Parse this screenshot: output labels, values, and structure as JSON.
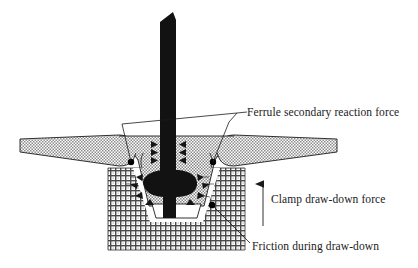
{
  "figure": {
    "type": "engineering-cross-section",
    "background_color": "#ffffff",
    "ink_color": "#000000"
  },
  "annotations": [
    {
      "id": "ferrule-secondary-reaction-force",
      "text": "Ferrule secondary reaction force",
      "leader": "two-branch",
      "points_to": [
        "ferrule-flange-left-corner",
        "ferrule-flange-right-corner"
      ]
    },
    {
      "id": "clamp-draw-down-force",
      "text": "Clamp draw-down force",
      "leader": "vertical-arrow-up",
      "direction": "up"
    },
    {
      "id": "friction-during-draw-down",
      "text": "Friction during draw-down",
      "leader": "diagonal",
      "points_to": [
        "ferrule-base-right-corner"
      ]
    }
  ],
  "parts": [
    {
      "id": "bolt-shaft",
      "label": "bolt shaft",
      "fill": "solid-black"
    },
    {
      "id": "bolt-bulge",
      "label": "upset bolt head bulge",
      "fill": "solid-black"
    },
    {
      "id": "panel-plate",
      "label": "sheet panel",
      "fill": "fine-crosshatch"
    },
    {
      "id": "ferrule",
      "label": "ferrule",
      "fill": "diagonal-crosshatch"
    },
    {
      "id": "base-block",
      "label": "base block",
      "fill": "grid-mesh"
    },
    {
      "id": "cavity",
      "label": "cavity",
      "fill": "white"
    }
  ],
  "force_arrows": {
    "radial_count": 8,
    "upper_pairs": 3,
    "description": "arrows radiate outward from the bolt bulge into the ferrule wall"
  },
  "colors": {
    "ink": "#000000",
    "hatch_light": "#9a9a9a",
    "hatch_mid": "#6e6e6e",
    "paper": "#ffffff"
  }
}
